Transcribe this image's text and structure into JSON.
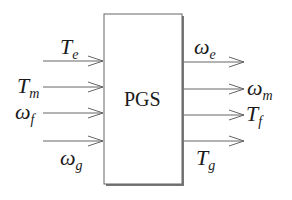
{
  "diagram": {
    "block": {
      "label": "PGS"
    },
    "inputs": [
      {
        "symbol": "T",
        "sub": "e"
      },
      {
        "symbol": "T",
        "sub": "m"
      },
      {
        "symbol": "ω",
        "sub": "f"
      },
      {
        "symbol": "ω",
        "sub": "g"
      }
    ],
    "outputs": [
      {
        "symbol": "ω",
        "sub": "e"
      },
      {
        "symbol": "ω",
        "sub": "m"
      },
      {
        "symbol": "T",
        "sub": "f"
      },
      {
        "symbol": "T",
        "sub": "g"
      }
    ],
    "colors": {
      "line": "#555555",
      "box_shadow": "#666666",
      "text": "#1a1a1a"
    }
  }
}
